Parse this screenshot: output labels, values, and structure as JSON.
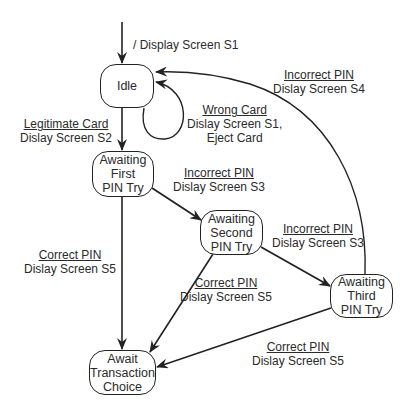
{
  "diagram": {
    "type": "state-machine",
    "states": {
      "idle": "Idle",
      "first": [
        "Awaiting",
        "First",
        "PIN Try"
      ],
      "second": [
        "Awaiting",
        "Second",
        "PIN Try"
      ],
      "third": [
        "Awaiting",
        "Third",
        "PIN Try"
      ],
      "transaction": [
        "Await",
        "Transaction",
        "Choice"
      ]
    },
    "transitions": {
      "initial": {
        "action": "/ Display Screen S1"
      },
      "idle_to_first": {
        "event": "Legitimate Card",
        "action": "Dislay Screen S2"
      },
      "idle_self": {
        "event": "Wrong Card",
        "action": "Dislay Screen S1,",
        "action2": "Eject Card"
      },
      "third_to_idle": {
        "event": "Incorrect PIN",
        "action": "Dislay Screen S4"
      },
      "first_to_second": {
        "event": "Incorrect PIN",
        "action": "Dislay Screen S3"
      },
      "second_to_third": {
        "event": "Incorrect PIN",
        "action": "Dislay Screen S3"
      },
      "first_to_transaction": {
        "event": "Correct PIN",
        "action": "Dislay Screen S5"
      },
      "second_to_transaction": {
        "event": "Correct PIN",
        "action": "Dislay Screen S5"
      },
      "third_to_transaction": {
        "event": "Correct PIN",
        "action": "Dislay Screen S5"
      }
    }
  }
}
